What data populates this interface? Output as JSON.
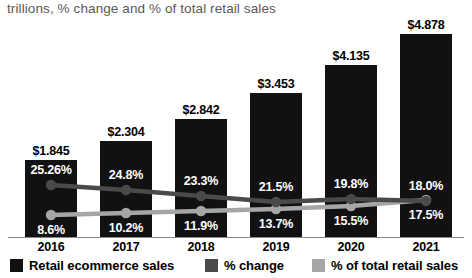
{
  "subtitle": "trillions, % change and % of total retail sales",
  "chart_data": {
    "type": "bar",
    "title": "",
    "subtitle": "trillions, % change and % of total retail sales",
    "xlabel": "",
    "ylabel": "",
    "grid": false,
    "legend_position": "bottom",
    "categories": [
      "2016",
      "2017",
      "2018",
      "2019",
      "2020",
      "2021"
    ],
    "series": [
      {
        "name": "Retail ecommerce sales",
        "type": "bar",
        "color": "#111111",
        "unit": "trillions USD",
        "values": [
          1.845,
          2.304,
          2.842,
          3.453,
          4.135,
          4.878
        ],
        "labels": [
          "$1.845",
          "$2.304",
          "$2.842",
          "$3.453",
          "$4.135",
          "$4.878"
        ]
      },
      {
        "name": "% change",
        "type": "line",
        "color": "#4a4a4a",
        "unit": "percent",
        "values": [
          25.26,
          24.8,
          23.3,
          21.5,
          19.8,
          18.0
        ],
        "labels": [
          "25.26%",
          "24.8%",
          "23.3%",
          "21.5%",
          "19.8%",
          "18.0%"
        ]
      },
      {
        "name": "% of total retail sales",
        "type": "line",
        "color": "#a6a6a6",
        "unit": "percent",
        "values": [
          8.6,
          10.2,
          11.9,
          13.7,
          15.5,
          17.5
        ],
        "labels": [
          "8.6%",
          "10.2%",
          "11.9%",
          "13.7%",
          "15.5%",
          "17.5%"
        ]
      }
    ]
  },
  "legend": [
    {
      "label": "Retail ecommerce sales",
      "color": "#111111"
    },
    {
      "label": "% change",
      "color": "#4a4a4a"
    },
    {
      "label": "% of total retail sales",
      "color": "#a6a6a6"
    }
  ]
}
